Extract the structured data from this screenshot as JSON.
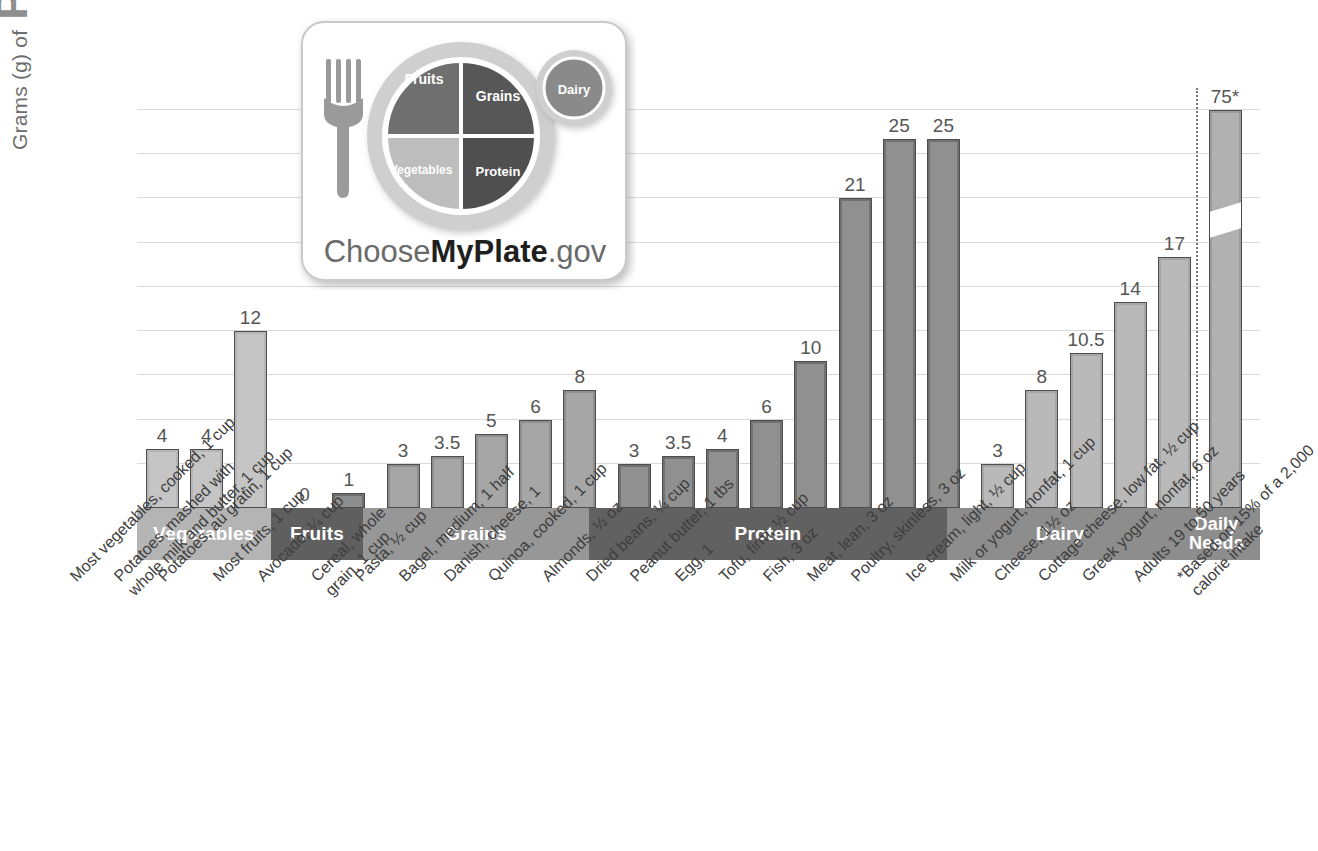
{
  "y_axis": {
    "prefix": "Grams (g) of",
    "emphasis": "Protein"
  },
  "logo": {
    "wordmark_1": "Choose",
    "wordmark_2": "MyPlate",
    "wordmark_3": ".gov",
    "segments": {
      "fruits": "Fruits",
      "grains": "Grains",
      "vegetables": "Vegetables",
      "protein": "Protein",
      "dairy": "Dairy"
    }
  },
  "groups": [
    {
      "label": "Vegetables",
      "count": 3
    },
    {
      "label": "Fruits",
      "count": 2
    },
    {
      "label": "Grains",
      "count": 5
    },
    {
      "label": "Protein",
      "count": 8
    },
    {
      "label": "Dairy",
      "count": 5
    },
    {
      "label": "Daily\nNeeds",
      "label_line1": "Daily",
      "label_line2": "Needs",
      "count": 1
    }
  ],
  "chart_data": {
    "type": "bar",
    "title": "",
    "xlabel": "",
    "ylabel": "Grams (g) of Protein",
    "ylim": [
      0,
      27
    ],
    "grid": true,
    "legend": "none",
    "note": "*Based on 15% of a 2,000 calorie intake",
    "broken_axis": {
      "applies_to": "Adults 19 to 50 years",
      "displayed_value": "75*",
      "actual_value": 75
    },
    "categories": [
      "Most vegetables, cooked, 1 cup",
      "Potatoes, mashed with whole milk and butter, 1 cup",
      "Potatoes, au gratin, 1 cup",
      "Most fruits, 1 cup",
      "Avocado, 1/4 cup",
      "Cereal, whole grain, 1 cup",
      "Pasta, 1/2 cup",
      "Bagel, medium, 1 half",
      "Danish, cheese, 1",
      "Quinoa, cooked, 1 cup",
      "Almonds, 1/2 oz",
      "Dried beans, 1/4 cup",
      "Peanut butter, 1 tbs",
      "Egg, 1",
      "Tofu, firm, 1/2 cup",
      "Fish, 3 oz",
      "Meat, lean, 3 oz",
      "Poultry, skinless, 3 oz",
      "Ice cream, light, 1/2 cup",
      "Milk or yogurt, nonfat, 1 cup",
      "Cheese, 1 1/2 oz",
      "Cottage cheese, low fat, 1/2 cup",
      "Greek yogurt, nonfat, 6 oz",
      "Adults 19 to 50 years"
    ],
    "values": [
      4,
      4,
      12,
      0,
      1,
      3,
      3.5,
      5,
      6,
      8,
      3,
      3.5,
      4,
      6,
      10,
      21,
      25,
      25,
      3,
      8,
      10.5,
      14,
      17,
      75
    ],
    "value_labels": [
      "4",
      "4",
      "12",
      "0",
      "1",
      "3",
      "3.5",
      "5",
      "6",
      "8",
      "3",
      "3.5",
      "4",
      "6",
      "10",
      "21",
      "25",
      "25",
      "3",
      "8",
      "10.5",
      "14",
      "17",
      "75*"
    ],
    "group_of": [
      "Vegetables",
      "Vegetables",
      "Vegetables",
      "Fruits",
      "Fruits",
      "Grains",
      "Grains",
      "Grains",
      "Grains",
      "Grains",
      "Protein",
      "Protein",
      "Protein",
      "Protein",
      "Protein",
      "Protein",
      "Protein",
      "Protein",
      "Dairy",
      "Dairy",
      "Dairy",
      "Dairy",
      "Dairy",
      "Daily Needs"
    ]
  },
  "tick_labels": [
    {
      "line1": "Most vegetables, cooked, 1 cup",
      "line2": ""
    },
    {
      "line1": "Potatoes, mashed with",
      "line2": "whole milk and butter, 1 cup"
    },
    {
      "line1": "Potatoes, au gratin, 1 cup",
      "line2": ""
    },
    {
      "line1": "Most fruits, 1 cup",
      "line2": ""
    },
    {
      "line1": "Avocado, ¼ cup",
      "line2": ""
    },
    {
      "line1": "Cereal, whole",
      "line2": "grain, 1 cup"
    },
    {
      "line1": "Pasta, ½ cup",
      "line2": ""
    },
    {
      "line1": "Bagel, medium, 1 half",
      "line2": ""
    },
    {
      "line1": "Danish, cheese, 1",
      "line2": ""
    },
    {
      "line1": "Quinoa, cooked, 1 cup",
      "line2": ""
    },
    {
      "line1": "Almonds, ½ oz",
      "line2": ""
    },
    {
      "line1": "Dried beans, ¼ cup",
      "line2": ""
    },
    {
      "line1": "Peanut butter, 1 tbs",
      "line2": ""
    },
    {
      "line1": "Egg, 1",
      "line2": ""
    },
    {
      "line1": "Tofu, firm, ½ cup",
      "line2": ""
    },
    {
      "line1": "Fish, 3 oz",
      "line2": ""
    },
    {
      "line1": "Meat, lean, 3 oz",
      "line2": ""
    },
    {
      "line1": "Poultry, skinless, 3 oz",
      "line2": ""
    },
    {
      "line1": "Ice cream, light, ½ cup",
      "line2": ""
    },
    {
      "line1": "Milk or yogurt, nonfat, 1 cup",
      "line2": ""
    },
    {
      "line1": "Cheese, 1½ oz",
      "line2": ""
    },
    {
      "line1": "Cottage cheese, low fat, ½ cup",
      "line2": ""
    },
    {
      "line1": "Greek yogurt, nonfat, 6 oz",
      "line2": ""
    },
    {
      "line1": "Adults 19 to 50 years",
      "line2": ""
    },
    {
      "line1": "*Based on 15% of a 2,000",
      "line2": "calorie intake"
    }
  ],
  "colors": {
    "gridline": "#d9d9d9",
    "band_vegetables": "#b4b4b4",
    "band_fruits": "#5f5f5f",
    "band_grains": "#979797",
    "band_protein": "#616161",
    "band_dairy": "#8d8d8d",
    "bar_outline": "#4d4d4d",
    "value_text": "#555555",
    "axis_title": "#8f8f8f"
  }
}
